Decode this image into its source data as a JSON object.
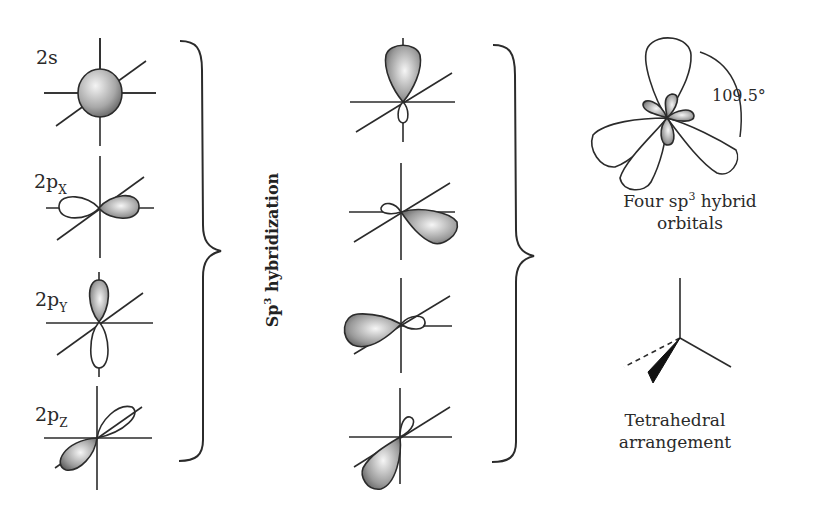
{
  "figure": {
    "title": "Sp3 hybridization",
    "process_label": {
      "base": "Sp",
      "superscript": "3",
      "rest": " hybridization"
    },
    "atomic_orbitals": [
      {
        "label_base": "2s",
        "label_sub": "",
        "shape": "sphere"
      },
      {
        "label_base": "2p",
        "label_sub": "X",
        "shape": "dumbbell-horizontal"
      },
      {
        "label_base": "2p",
        "label_sub": "Y",
        "shape": "dumbbell-vertical"
      },
      {
        "label_base": "2p",
        "label_sub": "Z",
        "shape": "dumbbell-diagonal"
      }
    ],
    "hybrid_orbitals": [
      {
        "direction": "up"
      },
      {
        "direction": "right-down"
      },
      {
        "direction": "left"
      },
      {
        "direction": "down-left"
      }
    ],
    "result": {
      "angle_label": "109.5°",
      "caption_line1_base": "Four sp",
      "caption_line1_sup": "3",
      "caption_line1_rest": " hybrid",
      "caption_line2": "orbitals"
    },
    "geometry": {
      "caption_line1": "Tetrahedral",
      "caption_line2": "arrangement"
    },
    "colors": {
      "line": "#2b2b2b",
      "shade_dark": "#6e6e6e",
      "shade_light": "#f2f2f2",
      "background": "#ffffff"
    }
  }
}
